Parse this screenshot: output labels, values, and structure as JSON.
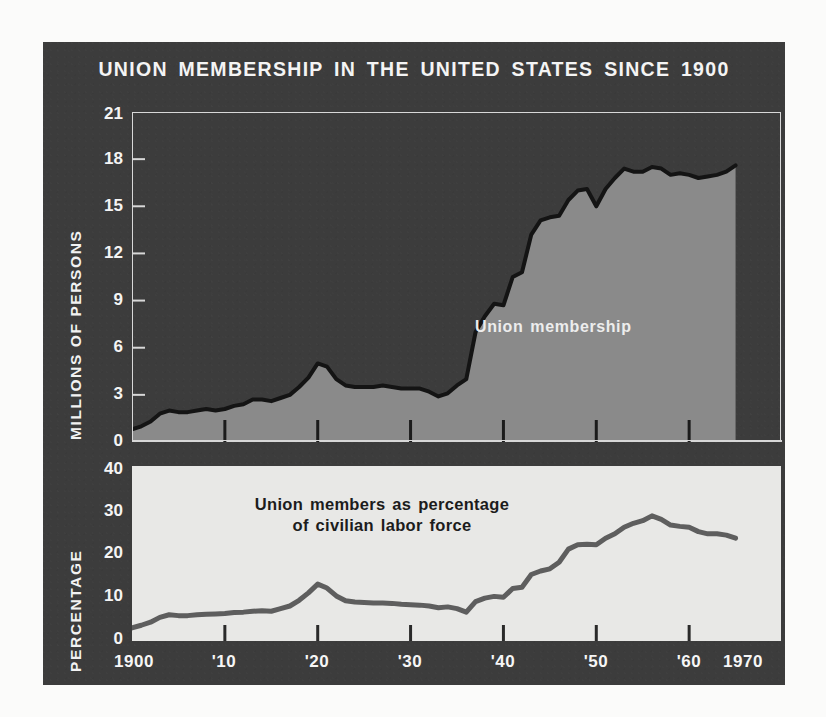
{
  "title": "UNION MEMBERSHIP IN THE UNITED STATES SINCE 1900",
  "colors": {
    "panel_background": "#3c3c3c",
    "page_background": "#fbfbfa",
    "area_fill": "#8a8a8a",
    "curve_line": "#141414",
    "bottom_panel": "#e8e8e6",
    "bottom_line": "#5e5e5e",
    "frame": "#d8d8d8",
    "text_light": "#f4f4f4",
    "text_dark": "#1c1c1c"
  },
  "top_chart": {
    "ylabel": "MILLIONS OF PERSONS",
    "series_label": "Union membership",
    "yticks": [
      "21",
      "18",
      "15",
      "12",
      "9",
      "6",
      "3",
      "0"
    ]
  },
  "bottom_chart": {
    "ylabel": "PERCENTAGE",
    "series_label_line1": "Union members as percentage",
    "series_label_line2": "of civilian labor force",
    "yticks": [
      "40",
      "30",
      "20",
      "10",
      "0"
    ]
  },
  "xaxis": {
    "ticks": [
      "1900",
      "'10",
      "'20",
      "'30",
      "'40",
      "'50",
      "'60",
      "1970"
    ]
  },
  "chart_data": [
    {
      "type": "area",
      "title": "Union membership",
      "xlabel": "",
      "ylabel": "MILLIONS OF PERSONS",
      "xlim": [
        1900,
        1970
      ],
      "ylim": [
        0,
        21
      ],
      "yticks": [
        0,
        3,
        6,
        9,
        12,
        15,
        18,
        21
      ],
      "xticks": [
        1900,
        1910,
        1920,
        1930,
        1940,
        1950,
        1960,
        1970
      ],
      "grid": false,
      "legend": "inline-annotation",
      "x": [
        1900,
        1901,
        1902,
        1903,
        1904,
        1905,
        1906,
        1907,
        1908,
        1909,
        1910,
        1911,
        1912,
        1913,
        1914,
        1915,
        1916,
        1917,
        1918,
        1919,
        1920,
        1921,
        1922,
        1923,
        1924,
        1925,
        1926,
        1927,
        1928,
        1929,
        1930,
        1931,
        1932,
        1933,
        1934,
        1935,
        1936,
        1937,
        1938,
        1939,
        1940,
        1941,
        1942,
        1943,
        1944,
        1945,
        1946,
        1947,
        1948,
        1949,
        1950,
        1951,
        1952,
        1953,
        1954,
        1955,
        1956,
        1957,
        1958,
        1959,
        1960,
        1961,
        1962,
        1963,
        1964,
        1965
      ],
      "values": [
        0.8,
        1.0,
        1.3,
        1.8,
        2.0,
        1.9,
        1.9,
        2.0,
        2.1,
        2.0,
        2.1,
        2.3,
        2.4,
        2.7,
        2.7,
        2.6,
        2.8,
        3.0,
        3.5,
        4.1,
        5.0,
        4.8,
        4.0,
        3.6,
        3.5,
        3.5,
        3.5,
        3.6,
        3.5,
        3.4,
        3.4,
        3.4,
        3.2,
        2.9,
        3.1,
        3.6,
        4.0,
        7.0,
        8.0,
        8.8,
        8.7,
        10.5,
        10.8,
        13.2,
        14.1,
        14.3,
        14.4,
        15.4,
        16.0,
        16.1,
        15.0,
        16.1,
        16.8,
        17.4,
        17.2,
        17.2,
        17.5,
        17.4,
        17.0,
        17.1,
        17.0,
        16.8,
        16.9,
        17.0,
        17.2,
        17.6
      ],
      "units": "millions of persons"
    },
    {
      "type": "line",
      "title": "Union members as percentage of civilian labor force",
      "xlabel": "",
      "ylabel": "PERCENTAGE",
      "xlim": [
        1900,
        1970
      ],
      "ylim": [
        0,
        40
      ],
      "yticks": [
        0,
        10,
        20,
        30,
        40
      ],
      "xticks": [
        1900,
        1910,
        1920,
        1930,
        1940,
        1950,
        1960,
        1970
      ],
      "grid": false,
      "legend": "inline-annotation",
      "x": [
        1900,
        1901,
        1902,
        1903,
        1904,
        1905,
        1906,
        1907,
        1908,
        1909,
        1910,
        1911,
        1912,
        1913,
        1914,
        1915,
        1916,
        1917,
        1918,
        1919,
        1920,
        1921,
        1922,
        1923,
        1924,
        1925,
        1926,
        1927,
        1928,
        1929,
        1930,
        1931,
        1932,
        1933,
        1934,
        1935,
        1936,
        1937,
        1938,
        1939,
        1940,
        1941,
        1942,
        1943,
        1944,
        1945,
        1946,
        1947,
        1948,
        1949,
        1950,
        1951,
        1952,
        1953,
        1954,
        1955,
        1956,
        1957,
        1958,
        1959,
        1960,
        1961,
        1962,
        1963,
        1964,
        1965
      ],
      "values": [
        3.0,
        3.6,
        4.3,
        5.4,
        6.0,
        5.8,
        5.8,
        6.0,
        6.1,
        6.2,
        6.3,
        6.5,
        6.6,
        6.8,
        6.9,
        6.8,
        7.4,
        8.0,
        9.3,
        11.0,
        13.0,
        12.1,
        10.3,
        9.2,
        8.9,
        8.8,
        8.7,
        8.7,
        8.6,
        8.4,
        8.3,
        8.2,
        8.0,
        7.6,
        7.8,
        7.4,
        6.6,
        9.0,
        9.8,
        10.2,
        10.0,
        12.0,
        12.3,
        15.2,
        16.0,
        16.5,
        18.0,
        21.0,
        22.0,
        22.1,
        22.0,
        23.5,
        24.5,
        26.0,
        26.9,
        27.5,
        28.6,
        27.8,
        26.5,
        26.2,
        26.0,
        25.0,
        24.5,
        24.5,
        24.2,
        23.5
      ],
      "units": "percent of civilian labor force"
    }
  ]
}
